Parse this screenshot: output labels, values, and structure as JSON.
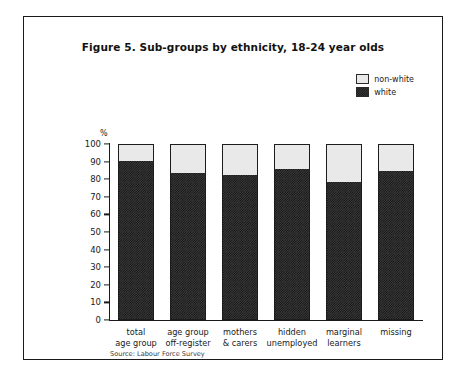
{
  "figure": {
    "title": "Figure 5. Sub-groups by ethnicity, 18-24 year olds",
    "source": "Source: Labour Force Survey",
    "y_unit": "%"
  },
  "legend": {
    "items": [
      {
        "label": "non-white",
        "swatch": "light-dotted-swatch",
        "color": "#e9e9e9"
      },
      {
        "label": "white",
        "swatch": "dark-checker-swatch",
        "color": "#1f1f1f"
      }
    ]
  },
  "chart_data": {
    "type": "bar",
    "stacked": true,
    "title": "Figure 5. Sub-groups by ethnicity, 18-24 year olds",
    "xlabel": "",
    "ylabel": "%",
    "ylim": [
      0,
      100
    ],
    "yticks": [
      0,
      10,
      20,
      30,
      40,
      50,
      60,
      70,
      80,
      90,
      100
    ],
    "grid": false,
    "legend_position": "top-right",
    "categories": [
      "total age group",
      "age group off-register",
      "mothers & carers",
      "hidden unemployed",
      "marginal learners",
      "missing"
    ],
    "category_lines": [
      [
        "total",
        "age group"
      ],
      [
        "age group",
        "off-register"
      ],
      [
        "mothers",
        "& carers"
      ],
      [
        "hidden",
        "unemployed"
      ],
      [
        "marginal",
        "learners"
      ],
      [
        "missing"
      ]
    ],
    "series": [
      {
        "name": "white",
        "values": [
          91,
          84,
          83,
          86,
          79,
          85
        ]
      },
      {
        "name": "non-white",
        "values": [
          9,
          16,
          17,
          14,
          21,
          15
        ]
      }
    ]
  }
}
